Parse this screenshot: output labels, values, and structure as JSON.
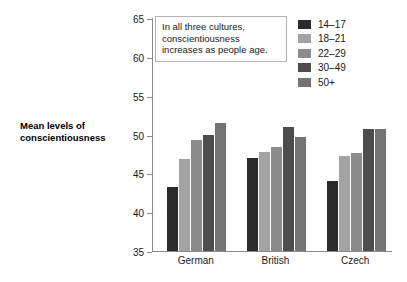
{
  "chart_data": {
    "type": "bar",
    "title": "",
    "xlabel": "",
    "ylabel": "Mean levels of conscientiousness",
    "ylim": [
      35,
      65
    ],
    "ytick_step": 5,
    "yticks": [
      35,
      40,
      45,
      50,
      55,
      60,
      65
    ],
    "grid": false,
    "legend_position": "top-right",
    "categories": [
      "German",
      "British",
      "Czech"
    ],
    "series": [
      {
        "name": "14–17",
        "color": "#2b2b2b",
        "values": [
          43.3,
          47.0,
          44.0
        ]
      },
      {
        "name": "18–21",
        "color": "#a3a3a3",
        "values": [
          46.9,
          47.8,
          47.2
        ]
      },
      {
        "name": "22–29",
        "color": "#8c8c8c",
        "values": [
          49.3,
          48.4,
          47.6
        ]
      },
      {
        "name": "30–49",
        "color": "#4d4d4d",
        "values": [
          50.0,
          51.0,
          50.7
        ]
      },
      {
        "name": "50+",
        "color": "#737373",
        "values": [
          51.5,
          49.7,
          50.7
        ]
      }
    ],
    "annotation": {
      "line1": "In all three cultures,",
      "line2": "conscientiousness",
      "line3": "increases as people age."
    }
  },
  "axis_title": {
    "line1": "Mean levels of",
    "line2": "conscientiousness"
  },
  "colors": {
    "axis": "#8a8a8a",
    "text": "#1a1a1a",
    "background": "#ffffff",
    "annotation_border": "#b4b4b4"
  }
}
